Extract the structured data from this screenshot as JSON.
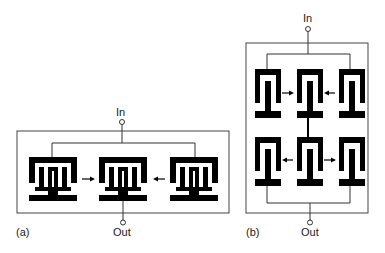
{
  "figure": {
    "panel_a": {
      "label": "(a)",
      "input_label": "In",
      "output_label": "Out",
      "layout": "1x3 resonator array",
      "arrows": [
        "left-to-center",
        "right-to-center"
      ]
    },
    "panel_b": {
      "label": "(b)",
      "input_label": "In",
      "output_label": "Out",
      "layout": "2x3 resonator array",
      "arrows": [
        "top-left-to-center",
        "top-right-to-center",
        "bottom-center-to-left",
        "bottom-center-to-right"
      ]
    },
    "colors": {
      "ink": "#000000",
      "line": "#333333",
      "background": "#ffffff"
    }
  }
}
